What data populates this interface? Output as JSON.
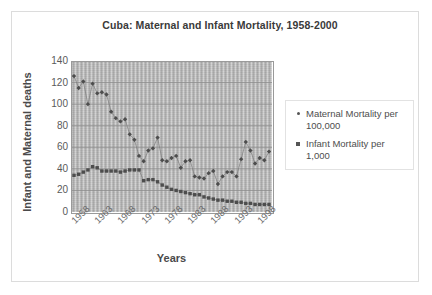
{
  "chart_data": {
    "type": "scatter",
    "title": "Cuba: Maternal and Infant Mortality, 1958-2000",
    "xlabel": "Years",
    "ylabel": "Infant and Maternal deaths",
    "xlim": [
      1958,
      2000
    ],
    "ylim": [
      0,
      140
    ],
    "ytick_values": [
      0,
      20,
      40,
      60,
      80,
      100,
      120,
      140
    ],
    "ytick_labels": [
      "0",
      "20",
      "40",
      "60",
      "80",
      "100",
      "120",
      "140"
    ],
    "xtick_labels": [
      "1958",
      "1963",
      "1968",
      "1973",
      "1978",
      "1983",
      "1988",
      "1993",
      "1998"
    ],
    "xtick_values": [
      1958,
      1963,
      1968,
      1973,
      1978,
      1983,
      1988,
      1993,
      1998
    ],
    "grid": "horizontal",
    "legend_position": "right",
    "plot_background": "#b9b9b9",
    "marker_color": "#4d4d4d",
    "line_color": "#7d7d7d",
    "x": [
      1958,
      1959,
      1960,
      1961,
      1962,
      1963,
      1964,
      1965,
      1966,
      1967,
      1968,
      1969,
      1970,
      1971,
      1972,
      1973,
      1974,
      1975,
      1976,
      1977,
      1978,
      1979,
      1980,
      1981,
      1982,
      1983,
      1984,
      1985,
      1986,
      1987,
      1988,
      1989,
      1990,
      1991,
      1992,
      1993,
      1994,
      1995,
      1996,
      1997,
      1998,
      1999,
      2000
    ],
    "series": [
      {
        "name": "Maternal Mortality per 100,000",
        "marker": "diamond",
        "values": [
          126,
          115,
          121,
          100,
          119,
          110,
          111,
          109,
          93,
          87,
          84,
          86,
          72,
          67,
          52,
          47,
          57,
          59,
          69,
          48,
          47,
          50,
          52,
          41,
          47,
          48,
          33,
          32,
          31,
          36,
          38,
          26,
          33,
          37,
          37,
          33,
          49,
          65,
          57,
          45,
          50,
          48,
          56
        ]
      },
      {
        "name": "Infant Mortality per 1,000",
        "marker": "square",
        "values": [
          34,
          35,
          37,
          39,
          42,
          41,
          38,
          38,
          38,
          38,
          37,
          38,
          39,
          39,
          39,
          29,
          30,
          30,
          28,
          25,
          23,
          21,
          20,
          19,
          18,
          17,
          16,
          16,
          14,
          13,
          12,
          11,
          11,
          10,
          10,
          9,
          9,
          8,
          8,
          7,
          7,
          7,
          7
        ]
      }
    ]
  },
  "legend": {
    "items": [
      {
        "label": "Maternal Mortality per 100,000",
        "marker": "dot"
      },
      {
        "label": "Infant Mortality per 1,000",
        "marker": "square"
      }
    ]
  }
}
